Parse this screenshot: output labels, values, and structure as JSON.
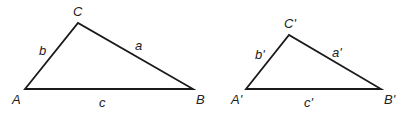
{
  "diagram": {
    "stroke_color": "#1a1a1a",
    "triangles": [
      {
        "id": "original",
        "vertices": {
          "A": {
            "label": "A",
            "x": 25,
            "y": 89,
            "lx": 12,
            "ly": 104
          },
          "B": {
            "label": "B",
            "x": 193,
            "y": 89,
            "lx": 196,
            "ly": 104
          },
          "C": {
            "label": "C",
            "x": 78,
            "y": 23,
            "lx": 73,
            "ly": 16
          }
        },
        "sides": {
          "a": {
            "label": "a",
            "lx": 135,
            "ly": 50
          },
          "b": {
            "label": "b",
            "lx": 39,
            "ly": 55
          },
          "c": {
            "label": "c",
            "lx": 99,
            "ly": 107
          }
        }
      },
      {
        "id": "similar",
        "vertices": {
          "A": {
            "label": "A'",
            "x": 246,
            "y": 89,
            "lx": 231,
            "ly": 104
          },
          "B": {
            "label": "B'",
            "x": 381,
            "y": 89,
            "lx": 384,
            "ly": 104
          },
          "C": {
            "label": "C'",
            "x": 289,
            "y": 35,
            "lx": 284,
            "ly": 28
          }
        },
        "sides": {
          "a": {
            "label": "a'",
            "lx": 332,
            "ly": 57
          },
          "b": {
            "label": "b'",
            "lx": 255,
            "ly": 59
          },
          "c": {
            "label": "c'",
            "lx": 304,
            "ly": 107
          }
        }
      }
    ]
  }
}
